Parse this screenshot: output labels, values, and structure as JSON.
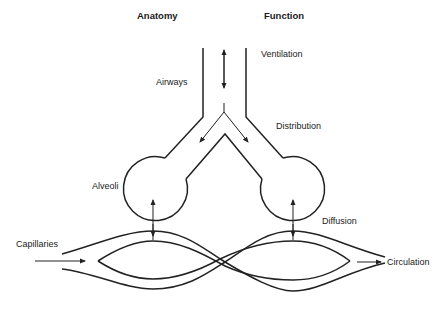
{
  "headers": {
    "anatomy": "Anatomy",
    "function": "Function"
  },
  "anatomy_labels": {
    "airways": "Airways",
    "alveoli": "Alveoli",
    "capillaries": "Capillaries"
  },
  "function_labels": {
    "ventilation": "Ventilation",
    "distribution": "Distribution",
    "diffusion": "Diffusion",
    "circulation": "Circulation"
  },
  "colors": {
    "line": "#222222",
    "background": "#ffffff"
  }
}
